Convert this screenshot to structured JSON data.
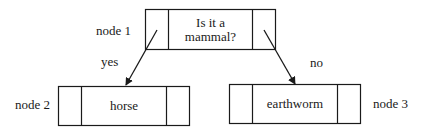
{
  "diagram": {
    "type": "decision-tree",
    "nodes": [
      {
        "id": "node1",
        "label": "node 1",
        "text_line1": "Is it a",
        "text_line2": "mammal?"
      },
      {
        "id": "node2",
        "label": "node 2",
        "text": "horse"
      },
      {
        "id": "node3",
        "label": "node 3",
        "text": "earthworm"
      }
    ],
    "edges": [
      {
        "from": "node1",
        "to": "node2",
        "label": "yes"
      },
      {
        "from": "node1",
        "to": "node3",
        "label": "no"
      }
    ],
    "colors": {
      "stroke": "#1a1a1a",
      "background": "#ffffff"
    }
  }
}
